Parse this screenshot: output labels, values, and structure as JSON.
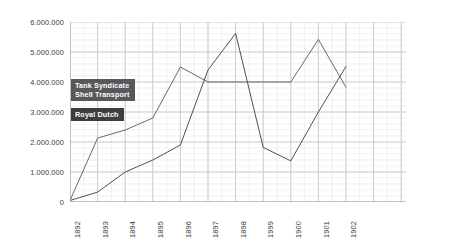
{
  "chart_data": {
    "type": "line",
    "title": "",
    "subtitle": "",
    "xlabel": "",
    "ylabel": "",
    "x": [
      "1892",
      "1893",
      "1894",
      "1895",
      "1896",
      "1897",
      "1898",
      "1999",
      "1900",
      "1901",
      "1902"
    ],
    "categories": [
      "1892",
      "1893",
      "1894",
      "1895",
      "1896",
      "1897",
      "1898",
      "1999",
      "1900",
      "1901",
      "1902"
    ],
    "ylim": [
      0,
      6000000
    ],
    "ytick_values": [
      0,
      1000000,
      2000000,
      3000000,
      4000000,
      5000000,
      6000000
    ],
    "ytick_labels": [
      "0",
      "1.000.000",
      "2.000.000",
      "3.000.000",
      "4.000.000",
      "5.000.000",
      "6.000.000"
    ],
    "grid": true,
    "grid_axis": "both",
    "legend_position": "inside-left",
    "number_format": "european-dot-thousands",
    "series": [
      {
        "name": "Tank Syndicate Shell Transport",
        "label_lines": [
          "Tank Syndicate",
          "Shell Transport"
        ],
        "color": "#58585a",
        "values": [
          50000,
          2130000,
          2400000,
          2800000,
          4500000,
          4000000,
          4000000,
          4000000,
          4000000,
          5420000,
          3820000
        ]
      },
      {
        "name": "Royal Dutch",
        "label_lines": [
          "Royal Dutch"
        ],
        "color": "#3d3d3f",
        "values": [
          50000,
          330000,
          1000000,
          1400000,
          1900000,
          4400000,
          5620000,
          1820000,
          1370000,
          3000000,
          4520000
        ]
      }
    ],
    "annotations": [
      {
        "text": "1999 tick label appears as printed (reads 1999 between 1898 and 1900)"
      }
    ]
  },
  "legend": {
    "entries": [
      {
        "id": "tank-syndicate-shell-transport",
        "line1": "Tank Syndicate",
        "line2": "Shell Transport"
      },
      {
        "id": "royal-dutch",
        "line1": "Royal Dutch",
        "line2": ""
      }
    ]
  },
  "axes": {
    "y": {
      "ticks": [
        "6.000.000",
        "5.000.000",
        "4.000.000",
        "3.000.000",
        "2.000.000",
        "1.000.000",
        "0"
      ]
    },
    "x": {
      "ticks": [
        "1892",
        "1893",
        "1894",
        "1895",
        "1896",
        "1897",
        "1898",
        "1999",
        "1900",
        "1901",
        "1902"
      ]
    }
  },
  "colors": {
    "series_a": "#58585a",
    "series_b": "#3d3d3f",
    "grid": "#c9c9c9",
    "grid_minor": "#e6e6e6",
    "axis": "#9a9a9a",
    "background": "#ffffff",
    "text": "#3a3a3a"
  }
}
